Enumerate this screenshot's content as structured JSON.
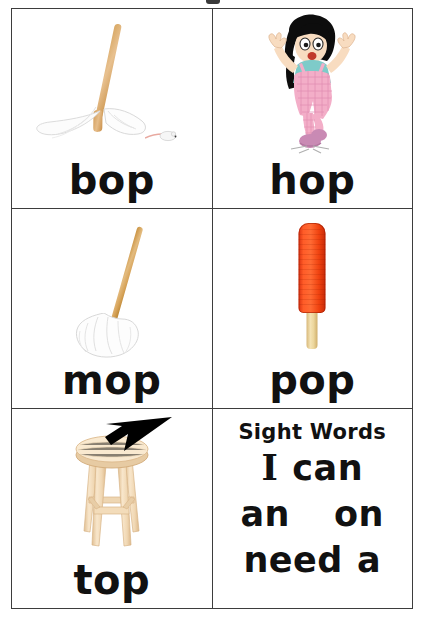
{
  "worksheet": {
    "title_remnant": "",
    "grid": {
      "rows": 3,
      "columns": 2
    }
  },
  "cards": [
    {
      "id": "bop",
      "word": "bop",
      "picture_name": "mop-lying-down-with-mouse-illustration",
      "picture_description": "A white mop lying on its side with a wooden handle and a small white mouse",
      "colors": {
        "handle": "#d8a864",
        "head": "#f7f7f7",
        "mouse": "#f2f2f2"
      }
    },
    {
      "id": "hop",
      "word": "hop",
      "picture_name": "girl-hopping-illustration",
      "picture_description": "A cartoon girl with black hair, teal shirt and pink checkered overalls hopping on one foot",
      "colors": {
        "hair": "#111111",
        "shirt": "#7ecbc9",
        "overalls": "#f3aec8",
        "skin": "#f7d9b8",
        "shoes": "#c98ab4"
      }
    },
    {
      "id": "mop",
      "word": "mop",
      "picture_name": "mop-upright-illustration",
      "picture_description": "A mop standing at an angle with a long wooden handle and a white mop head",
      "colors": {
        "handle": "#d7a359",
        "head": "#fbfbfb"
      }
    },
    {
      "id": "pop",
      "word": "pop",
      "picture_name": "red-popsicle-illustration",
      "picture_description": "A red ice pop on a tan wooden stick",
      "colors": {
        "ice": "#ff5c28",
        "stick": "#ecd69c"
      }
    },
    {
      "id": "top",
      "word": "top",
      "picture_name": "wooden-stool-with-arrow-illustration",
      "picture_description": "A light wooden four-legged stool with a black arrow pointing to its top seat",
      "colors": {
        "wood": "#f5dfc0",
        "wood_shade": "#e2c49c",
        "arrow": "#000000"
      }
    }
  ],
  "sight_words": {
    "heading": "Sight Words",
    "rows": [
      {
        "left": "I",
        "right": "can",
        "left_style": "serif"
      },
      {
        "left": "an",
        "right": "on",
        "left_style": "sans"
      },
      {
        "left": "need",
        "right": "a",
        "left_style": "sans"
      }
    ]
  },
  "colors": {
    "border": "#3d3d3d",
    "text": "#111111",
    "background": "#ffffff"
  }
}
